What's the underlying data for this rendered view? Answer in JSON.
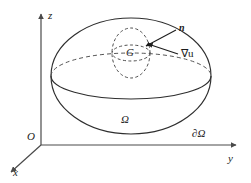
{
  "figure": {
    "kind": "math-diagram",
    "background_color": "#ffffff",
    "stroke_color": "#2e2e2e",
    "dashed_color": "#555555"
  },
  "axes": {
    "z_label": "z",
    "y_label": "y",
    "x_label": "x",
    "origin_label": "O"
  },
  "labels": {
    "domain": "Ω",
    "boundary": "∂Ω",
    "subdomain": "G",
    "normal": "n",
    "gradient": "∇u"
  },
  "geometry": {
    "origin": {
      "x": 41,
      "y": 145
    },
    "ellipsoid": {
      "cx": 131,
      "cy": 76,
      "rx": 80,
      "ry": 58
    },
    "equator": {
      "cx": 131,
      "cy": 76,
      "rx": 80,
      "ry": 23
    },
    "subdomain_sphere": {
      "cx": 131,
      "cy": 53,
      "rx": 19,
      "ry": 25
    },
    "subdomain_equator": {
      "cx": 131,
      "cy": 53,
      "rx": 19,
      "ry": 8
    }
  }
}
